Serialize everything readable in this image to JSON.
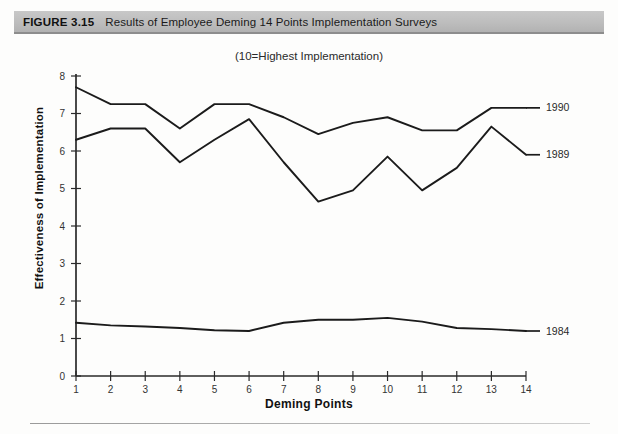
{
  "caption": {
    "number": "FIGURE 3.15",
    "text": "Results of Employee Deming 14 Points Implementation Surveys"
  },
  "subtitle": "(10=Highest Implementation)",
  "chart_data": {
    "type": "line",
    "title": "Results of Employee Deming 14 Points Implementation Surveys",
    "subtitle": "(10=Highest Implementation)",
    "xlabel": "Deming Points",
    "ylabel": "Effectiveness of Implementation",
    "x": [
      1,
      2,
      3,
      4,
      5,
      6,
      7,
      8,
      9,
      10,
      11,
      12,
      13,
      14
    ],
    "xtick_labels": [
      "1",
      "2",
      "3",
      "4",
      "5",
      "6",
      "7",
      "8",
      "9",
      "10",
      "11",
      "12",
      "13",
      "14"
    ],
    "ytick_labels": [
      "0",
      "1",
      "2",
      "3",
      "4",
      "5",
      "6",
      "7",
      "8"
    ],
    "xlim": [
      1,
      14
    ],
    "ylim": [
      0,
      8
    ],
    "grid": false,
    "legend_position": "right-inline",
    "series": [
      {
        "name": "1990",
        "color": "#1b1b1b",
        "label_value": 7.15,
        "values": [
          7.7,
          7.25,
          7.25,
          6.6,
          7.25,
          7.25,
          6.9,
          6.45,
          6.75,
          6.9,
          6.55,
          6.55,
          7.15,
          7.15
        ]
      },
      {
        "name": "1989",
        "color": "#1b1b1b",
        "label_value": 5.9,
        "values": [
          6.3,
          6.6,
          6.6,
          5.7,
          6.3,
          6.85,
          5.7,
          4.65,
          4.95,
          5.85,
          4.95,
          5.55,
          6.65,
          5.9
        ]
      },
      {
        "name": "1984",
        "color": "#1b1b1b",
        "label_value": 1.2,
        "values": [
          1.42,
          1.35,
          1.32,
          1.28,
          1.22,
          1.2,
          1.42,
          1.5,
          1.5,
          1.55,
          1.45,
          1.28,
          1.25,
          1.2
        ]
      }
    ]
  }
}
